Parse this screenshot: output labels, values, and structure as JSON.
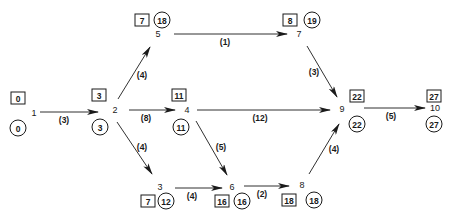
{
  "diagram": {
    "type": "activity-on-arrow project network",
    "nodes": [
      {
        "id": "1",
        "label": "1",
        "earliest": "0",
        "latest": "0",
        "lx": 34,
        "ly": 113,
        "bx": 18,
        "by": 98,
        "cx": 18,
        "cy": 128
      },
      {
        "id": "2",
        "label": "2",
        "earliest": "3",
        "latest": "3",
        "lx": 115,
        "ly": 110,
        "bx": 99,
        "by": 95,
        "cx": 100,
        "cy": 127
      },
      {
        "id": "3",
        "label": "3",
        "earliest": "7",
        "latest": "12",
        "lx": 160,
        "ly": 187,
        "bx": 148,
        "by": 201,
        "cx": 166,
        "cy": 201
      },
      {
        "id": "4",
        "label": "4",
        "earliest": "11",
        "latest": "11",
        "lx": 187,
        "ly": 110,
        "bx": 179,
        "by": 95,
        "cx": 181,
        "cy": 127
      },
      {
        "id": "5",
        "label": "5",
        "earliest": "7",
        "latest": "18",
        "lx": 158,
        "ly": 34,
        "bx": 142,
        "by": 20,
        "cx": 162,
        "cy": 20
      },
      {
        "id": "6",
        "label": "6",
        "earliest": "16",
        "latest": "16",
        "lx": 232,
        "ly": 187,
        "bx": 222,
        "by": 201,
        "cx": 242,
        "cy": 201
      },
      {
        "id": "7",
        "label": "7",
        "earliest": "8",
        "latest": "19",
        "lx": 299,
        "ly": 34,
        "bx": 290,
        "by": 20,
        "cx": 312,
        "cy": 20
      },
      {
        "id": "8",
        "label": "8",
        "earliest": "18",
        "latest": "18",
        "lx": 302,
        "ly": 185,
        "bx": 289,
        "by": 200,
        "cx": 314,
        "cy": 200
      },
      {
        "id": "9",
        "label": "9",
        "earliest": "22",
        "latest": "22",
        "lx": 342,
        "ly": 109,
        "bx": 357,
        "by": 96,
        "cx": 357,
        "cy": 124
      },
      {
        "id": "10",
        "label": "10",
        "earliest": "27",
        "latest": "27",
        "lx": 435,
        "ly": 108,
        "bx": 434,
        "by": 96,
        "cx": 434,
        "cy": 124
      }
    ],
    "activities": [
      {
        "from": "1",
        "to": "2",
        "duration": "(3)",
        "x1": 40,
        "y1": 112,
        "x2": 98,
        "y2": 112,
        "tx": 64,
        "ty": 120
      },
      {
        "from": "2",
        "to": "5",
        "duration": "(4)",
        "x1": 118,
        "y1": 99,
        "x2": 150,
        "y2": 47,
        "tx": 142,
        "ty": 75
      },
      {
        "from": "2",
        "to": "4",
        "duration": "(8)",
        "x1": 129,
        "y1": 110,
        "x2": 175,
        "y2": 110,
        "tx": 146,
        "ty": 118
      },
      {
        "from": "2",
        "to": "3",
        "duration": "(4)",
        "x1": 117,
        "y1": 122,
        "x2": 152,
        "y2": 174,
        "tx": 142,
        "ty": 147
      },
      {
        "from": "5",
        "to": "7",
        "duration": "(1)",
        "x1": 174,
        "y1": 34,
        "x2": 287,
        "y2": 34,
        "tx": 225,
        "ty": 42
      },
      {
        "from": "4",
        "to": "9",
        "duration": "(12)",
        "x1": 197,
        "y1": 110,
        "x2": 330,
        "y2": 110,
        "tx": 260,
        "ty": 118
      },
      {
        "from": "4",
        "to": "6",
        "duration": "(5)",
        "x1": 196,
        "y1": 121,
        "x2": 227,
        "y2": 175,
        "tx": 221,
        "ty": 147
      },
      {
        "from": "3",
        "to": "6",
        "duration": "(4)",
        "x1": 175,
        "y1": 188,
        "x2": 222,
        "y2": 188,
        "tx": 192,
        "ty": 196
      },
      {
        "from": "6",
        "to": "8",
        "duration": "(2)",
        "x1": 244,
        "y1": 186,
        "x2": 289,
        "y2": 186,
        "tx": 262,
        "ty": 194
      },
      {
        "from": "7",
        "to": "9",
        "duration": "(3)",
        "x1": 307,
        "y1": 46,
        "x2": 337,
        "y2": 97,
        "tx": 314,
        "ty": 72
      },
      {
        "from": "8",
        "to": "9",
        "duration": "(4)",
        "x1": 309,
        "y1": 174,
        "x2": 339,
        "y2": 124,
        "tx": 334,
        "ty": 149
      },
      {
        "from": "9",
        "to": "10",
        "duration": "(5)",
        "x1": 364,
        "y1": 108,
        "x2": 425,
        "y2": 108,
        "tx": 391,
        "ty": 116
      }
    ],
    "legend": {
      "box_meaning": "earliest event time",
      "circle_meaning": "latest event time"
    },
    "colors": {
      "ink": "#1a1a1a",
      "background": "#ffffff"
    }
  }
}
